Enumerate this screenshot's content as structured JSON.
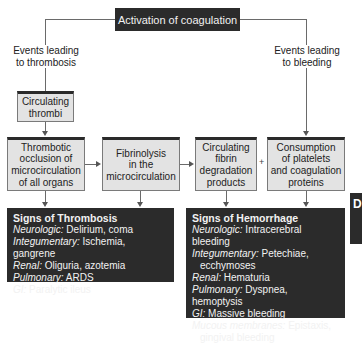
{
  "diagram": {
    "top": {
      "label": "Activation of coagulation"
    },
    "branches": {
      "thrombosis_label": "Events leading\nto thrombosis",
      "bleeding_label": "Events leading\nto bleeding"
    },
    "nodes": {
      "circulating_thrombi": "Circulating\nthrombi",
      "thrombotic_occlusion": "Thrombotic\nocclusion of\nmicrocirculation\nof all organs",
      "fibrinolysis": "Fibrinolysis\nin the\nmicrocirculation",
      "fibrin_degradation": "Circulating\nfibrin\ndegradation\nproducts",
      "plus": "+",
      "consumption": "Consumption\nof platelets\nand coagulation\nproteins"
    },
    "signs_thrombosis": {
      "title": "Signs of Thrombosis",
      "rows": [
        {
          "system": "Neurologic:",
          "signs": " Delirium, coma"
        },
        {
          "system": "Integumentary:",
          "signs": " Ischemia, gangrene"
        },
        {
          "system": "Renal:",
          "signs": " Oliguria, azotemia"
        },
        {
          "system": "Pulmonary:",
          "signs": " ARDS"
        },
        {
          "system": "GI:",
          "signs": " Paralytic ileus"
        }
      ]
    },
    "signs_hemorrhage": {
      "title": "Signs of Hemorrhage",
      "rows": [
        {
          "system": "Neurologic:",
          "signs": " Intracerebral bleeding"
        },
        {
          "system": "Integumentary:",
          "signs": " Petechiae,",
          "cont": "ecchymoses"
        },
        {
          "system": "Renal:",
          "signs": " Hematuria"
        },
        {
          "system": "Pulmonary:",
          "signs": " Dyspnea, hemoptysis"
        },
        {
          "system": "GI:",
          "signs": " Massive bleeding"
        },
        {
          "system": "Mucous membranes:",
          "signs": " Epistaxis,",
          "cont": "gingival bleeding"
        }
      ]
    },
    "side_tab": "D",
    "colors": {
      "dark_box": "#2b2b2b",
      "gray_box": "#e3e3e3",
      "line": "#6a6a6a"
    }
  }
}
